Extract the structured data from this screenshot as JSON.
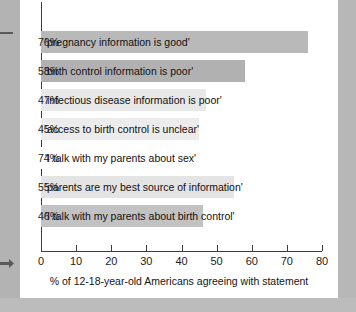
{
  "figure": {
    "axis_title": "% of 12-18-year-old Americans agreeing with statement",
    "tick_labels": [
      "0",
      "10",
      "20",
      "30",
      "40",
      "50",
      "60",
      "70",
      "80"
    ]
  },
  "chart_data": {
    "type": "bar",
    "orientation": "horizontal",
    "title": "",
    "subtitle": "",
    "xlabel": "% of 12-18-year-old Americans agreeing with statement",
    "ylabel": "",
    "xlim": [
      0,
      80
    ],
    "xticks": [
      0,
      10,
      20,
      30,
      40,
      50,
      60,
      70,
      80
    ],
    "grid": false,
    "legend": "none",
    "categories": [
      "'pregnancy information is good'",
      "'birth control information is poor'",
      "'infectious disease information is poor'",
      "'access to birth control is unclear'",
      "'I talk with my parents about sex'",
      "'parents are my best source of information'",
      "'I talk with my parents about birth control'"
    ],
    "values": [
      76,
      58,
      47,
      45,
      74,
      55,
      46
    ],
    "value_labels": [
      "76%",
      "58%",
      "47%",
      "45%",
      "74%",
      "55%",
      "46%"
    ],
    "bar_colors": [
      "#b9b9b9",
      "#b1b1b1",
      "#e8e8e8",
      "#ececec",
      "#ffffff",
      "#e4e4e4",
      "#c2c2c2"
    ],
    "bars": [
      {
        "label": "'pregnancy information is good'",
        "value": 76,
        "value_label": "76%",
        "color": "#b9b9b9",
        "hatched": true
      },
      {
        "label": "'birth control information is poor'",
        "value": 58,
        "value_label": "58%",
        "color": "#b1b1b1",
        "hatched": false
      },
      {
        "label": "'infectious disease information is poor'",
        "value": 47,
        "value_label": "47%",
        "color": "#e8e8e8",
        "hatched": false
      },
      {
        "label": "'access to birth control is unclear'",
        "value": 45,
        "value_label": "45%",
        "color": "#ececec",
        "hatched": false
      },
      {
        "label": "'I talk with my parents about sex'",
        "value": 74,
        "value_label": "74%",
        "color": "#ffffff",
        "hatched": false
      },
      {
        "label": "'parents are my best source of information'",
        "value": 55,
        "value_label": "55%",
        "color": "#e4e4e4",
        "hatched": false
      },
      {
        "label": "'I talk with my parents about birth control'",
        "value": 46,
        "value_label": "46%",
        "color": "#c2c2c2",
        "hatched": false
      }
    ]
  }
}
